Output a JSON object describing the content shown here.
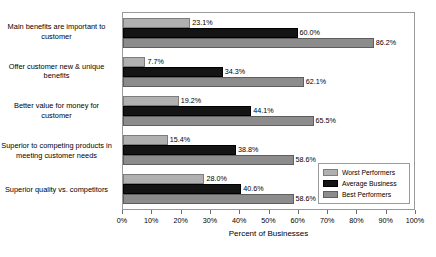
{
  "chart_data": {
    "type": "bar",
    "orientation": "horizontal",
    "title": "",
    "xlabel": "Percent of Businesses",
    "ylabel": "",
    "xlim": [
      0,
      100
    ],
    "grid": false,
    "legend_position": "lower-right-inset",
    "tick_labels": [
      "0%",
      "10%",
      "20%",
      "30%",
      "40%",
      "50%",
      "60%",
      "70%",
      "80%",
      "90%",
      "100%"
    ],
    "tick_values": [
      0,
      10,
      20,
      30,
      40,
      50,
      60,
      70,
      80,
      90,
      100
    ],
    "categories": [
      "Main benefits are important to customer",
      "Offer customer new & unique benefits",
      "Better value for money for customer",
      "Superior to competing products in meeting customer needs",
      "Superior quality vs. competitors"
    ],
    "series": [
      {
        "name": "Worst Performers",
        "color": "#b0b0b0",
        "values": [
          23.1,
          7.7,
          19.2,
          15.4,
          28.0
        ],
        "labels": [
          "23.1%",
          "7.7%",
          "19.2%",
          "15.4%",
          "28.0%"
        ]
      },
      {
        "name": "Average Business",
        "color": "#141414",
        "values": [
          60.0,
          34.3,
          44.1,
          38.8,
          40.6
        ],
        "labels": [
          "60.0%",
          "34.3%",
          "44.1%",
          "38.8%",
          "40.6%"
        ]
      },
      {
        "name": "Best Performers",
        "color": "#8c8c8c",
        "values": [
          86.2,
          62.1,
          65.5,
          58.6,
          58.6
        ],
        "labels": [
          "86.2%",
          "62.1%",
          "65.5%",
          "58.6%",
          "58.6%"
        ]
      }
    ]
  },
  "legend": {
    "items": [
      {
        "label": "Worst Performers"
      },
      {
        "label": "Average Business"
      },
      {
        "label": "Best Performers"
      }
    ]
  }
}
